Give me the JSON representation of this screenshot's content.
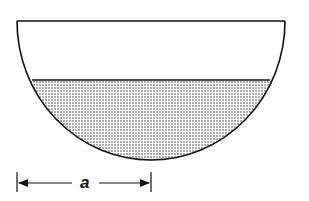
{
  "figure": {
    "type": "hemispherical-bowl-partially-filled",
    "dimension_label": "a",
    "dimension_meaning": "radius of the hemisphere (from left rim to center)",
    "colors": {
      "outline": "#111111",
      "fill_dots": "#333333",
      "background": "#ffffff"
    }
  }
}
